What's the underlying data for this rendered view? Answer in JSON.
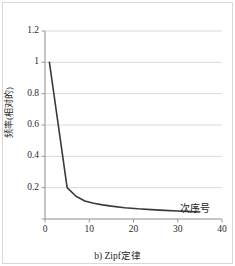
{
  "figure": {
    "caption": "b) Zipf定律",
    "background_color": "#ffffff",
    "border_color": "#d8d8d8"
  },
  "chart_data": {
    "type": "line",
    "title": "",
    "subtitle": "",
    "xlabel": "次序号",
    "ylabel": "频率(相对的)",
    "xlim": [
      0,
      40
    ],
    "ylim": [
      0,
      1.2
    ],
    "grid": "horizontal",
    "legend": "none",
    "line_color": "#3a3a3a",
    "grid_color": "#d9d9d9",
    "axis_color": "#9a9a9a",
    "xticks": [
      0,
      10,
      20,
      30,
      40
    ],
    "xtick_labels": [
      "0",
      "10",
      "20",
      "30",
      "40"
    ],
    "yticks": [
      0,
      0.2,
      0.4,
      0.6,
      0.8,
      1,
      1.2
    ],
    "ytick_labels": [
      "",
      "0.2",
      "0.4",
      "0.6",
      "0.8",
      "1",
      "1.2"
    ],
    "series": [
      {
        "name": "相对频率",
        "x": [
          1,
          5,
          7,
          9,
          11,
          13,
          15,
          18,
          21,
          24,
          27,
          30,
          33,
          35
        ],
        "y": [
          1.0,
          0.2,
          0.145,
          0.115,
          0.1,
          0.09,
          0.082,
          0.072,
          0.065,
          0.06,
          0.055,
          0.051,
          0.047,
          0.045
        ]
      }
    ]
  }
}
